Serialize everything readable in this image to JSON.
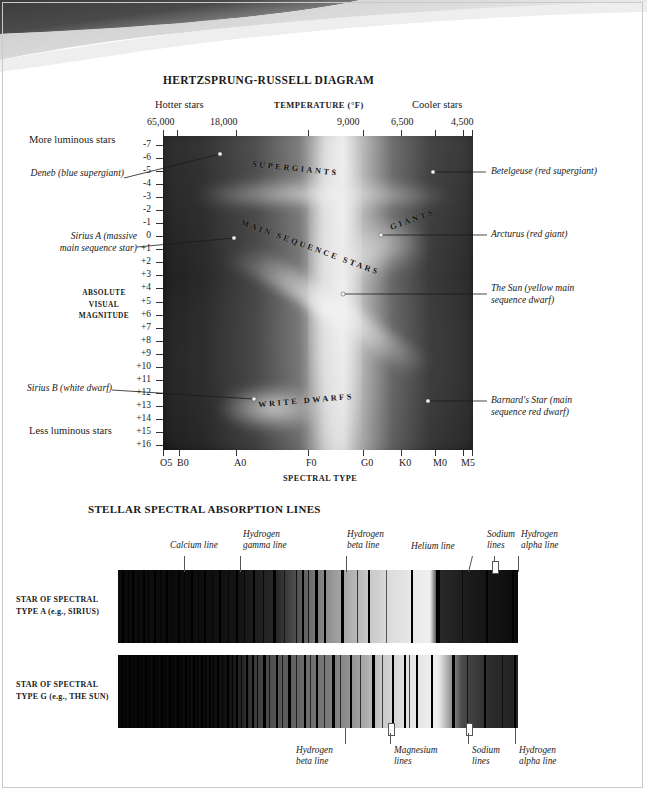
{
  "hr": {
    "title": "HERTZSPRUNG-RUSSELL DIAGRAM",
    "temperature_axis_title": "TEMPERATURE (°F)",
    "hotter_label": "Hotter stars",
    "cooler_label": "Cooler stars",
    "temperature_ticklabels": [
      "65,000",
      "18,000",
      "9,000",
      "6,500",
      "4,500"
    ],
    "spectral_axis_title": "SPECTRAL TYPE",
    "spectral_ticklabels": [
      "O5",
      "B0",
      "A0",
      "F0",
      "G0",
      "K0",
      "M0",
      "M5"
    ],
    "magnitude_axis_title": "ABSOLUTE VISUAL MAGNITUDE",
    "magnitude_axis_title_lines": [
      "ABSOLUTE",
      "VISUAL",
      "MAGNITUDE"
    ],
    "magnitude_ticklabels": [
      "-7",
      "-6",
      "-5",
      "-4",
      "-3",
      "-2",
      "-1",
      "0",
      "+1",
      "+2",
      "+3",
      "+4",
      "+5",
      "+6",
      "+7",
      "+8",
      "+9",
      "+10",
      "+11",
      "+12",
      "+13",
      "+14",
      "+15",
      "+16"
    ],
    "more_luminous_label": "More luminous stars",
    "less_luminous_label": "Less luminous stars",
    "regions": [
      {
        "label": "SUPERGIANTS"
      },
      {
        "label": "GIANTS"
      },
      {
        "label": "MAIN SEQUENCE STARS"
      },
      {
        "label": "WRITE DWARFS"
      }
    ],
    "callouts_left": [
      {
        "label": "Deneb (blue supergiant)"
      },
      {
        "label": "Sirius A (massive",
        "label2": "main sequence star)"
      },
      {
        "label": "Sirius B (white dwarf)"
      }
    ],
    "callouts_right": [
      {
        "label": "Betelgeuse (red supergiant)"
      },
      {
        "label": "Arcturus (red giant)"
      },
      {
        "label": "The Sun (yellow main",
        "label2": "sequence dwarf)"
      },
      {
        "label": "Barnard's Star (main",
        "label2": "sequence red dwarf)"
      }
    ]
  },
  "spectra": {
    "title": "STELLAR SPECTRAL ABSORPTION LINES",
    "row_a_label": "STAR OF SPECTRAL TYPE A (e.g., SIRIUS)",
    "row_g_label": "STAR OF SPECTRAL TYPE G (e.g., THE SUN)",
    "top_annotations": [
      {
        "l1": "Calcium line",
        "l2": ""
      },
      {
        "l1": "Hydrogen",
        "l2": "gamma line"
      },
      {
        "l1": "Hydrogen",
        "l2": "beta line"
      },
      {
        "l1": "Helium line",
        "l2": ""
      },
      {
        "l1": "Sodium",
        "l2": "lines"
      },
      {
        "l1": "Hydrogen",
        "l2": "alpha line"
      }
    ],
    "bottom_annotations": [
      {
        "l1": "Hydrogen",
        "l2": "beta line"
      },
      {
        "l1": "Magnesium",
        "l2": "lines"
      },
      {
        "l1": "Sodium",
        "l2": "lines"
      },
      {
        "l1": "Hydrogen",
        "l2": "alpha line"
      }
    ]
  },
  "chart_data": {
    "type": "scatter",
    "title": "HERTZSPRUNG-RUSSELL DIAGRAM",
    "xlabel": "SPECTRAL TYPE",
    "ylabel": "ABSOLUTE VISUAL MAGNITUDE",
    "x_secondary_label": "TEMPERATURE (°F)",
    "x_categories": [
      "O5",
      "B0",
      "A0",
      "F0",
      "G0",
      "K0",
      "M0",
      "M5"
    ],
    "x_temperature_ticks": [
      "65,000",
      "18,000",
      "9,000",
      "6,500",
      "4,500"
    ],
    "ylim": [
      -7,
      16
    ],
    "y_inverted": true,
    "grid": false,
    "legend": false,
    "annotations": [
      {
        "name": "Deneb (blue supergiant)",
        "spectral_type": "A2",
        "absolute_magnitude": -6.3
      },
      {
        "name": "Betelgeuse (red supergiant)",
        "spectral_type": "M2",
        "absolute_magnitude": -5.1
      },
      {
        "name": "Arcturus (red giant)",
        "spectral_type": "K2",
        "absolute_magnitude": -0.3
      },
      {
        "name": "Sirius A (massive main sequence star)",
        "spectral_type": "A1",
        "absolute_magnitude": 1.4
      },
      {
        "name": "The Sun (yellow main sequence dwarf)",
        "spectral_type": "G2",
        "absolute_magnitude": 4.8
      },
      {
        "name": "Sirius B (white dwarf)",
        "spectral_type": "F0",
        "absolute_magnitude": 11.4
      },
      {
        "name": "Barnard's Star (main sequence red dwarf)",
        "spectral_type": "M4",
        "absolute_magnitude": 13.2
      }
    ],
    "regions": [
      "SUPERGIANTS",
      "GIANTS",
      "MAIN SEQUENCE STARS",
      "WRITE DWARFS"
    ]
  }
}
